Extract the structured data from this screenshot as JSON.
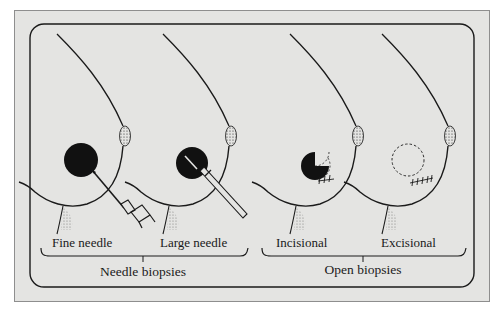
{
  "figure": {
    "colors": {
      "panel": "#e4e4e2",
      "ink": "#1a1a1a",
      "border": "#8e8e8e"
    },
    "panels": [
      {
        "id": "fine-needle",
        "label": "Fine needle"
      },
      {
        "id": "large-needle",
        "label": "Large needle"
      },
      {
        "id": "incisional",
        "label": "Incisional"
      },
      {
        "id": "excisional",
        "label": "Excisional"
      }
    ],
    "groups": [
      {
        "id": "needle-biopsies",
        "label": "Needle biopsies"
      },
      {
        "id": "open-biopsies",
        "label": "Open biopsies"
      }
    ]
  }
}
